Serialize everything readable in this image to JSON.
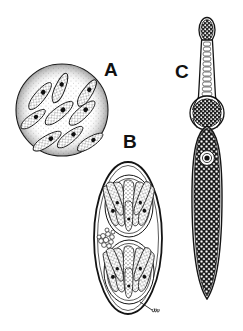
{
  "figure": {
    "kind": "scientific-line-illustration",
    "medium": "ink drawing, stippled",
    "background_color": "#ffffff",
    "ink_color": "#111111",
    "width": 243,
    "height": 331,
    "signature": "artist initials, lower right of panel B"
  },
  "labels": {
    "a": "A",
    "b": "B",
    "c": "C"
  },
  "panels": [
    {
      "id": "a",
      "label": "A",
      "name": "cyst-with-bradyzoites",
      "shape": "circle",
      "center": [
        62,
        110
      ],
      "radius": 46,
      "outline": "thin ink circle with dense stipple band inside rim",
      "contents": "nine elongated banana-shaped crescent cells, each stippled with a solid dark nucleus",
      "cell_count": 9,
      "cells": [
        {
          "cx": 40,
          "cy": 96,
          "angle": -52,
          "len": 34,
          "wid": 11,
          "nucleus_t": 0.62
        },
        {
          "cx": 60,
          "cy": 88,
          "angle": -68,
          "len": 32,
          "wid": 11,
          "nucleus_t": 0.58
        },
        {
          "cx": 86,
          "cy": 92,
          "angle": -58,
          "len": 31,
          "wid": 11,
          "nucleus_t": 0.6
        },
        {
          "cx": 33,
          "cy": 118,
          "angle": -38,
          "len": 30,
          "wid": 10,
          "nucleus_t": 0.58
        },
        {
          "cx": 59,
          "cy": 113,
          "angle": -40,
          "len": 35,
          "wid": 12,
          "nucleus_t": 0.6
        },
        {
          "cx": 82,
          "cy": 113,
          "angle": -44,
          "len": 34,
          "wid": 12,
          "nucleus_t": 0.58
        },
        {
          "cx": 47,
          "cy": 140,
          "angle": -34,
          "len": 33,
          "wid": 11,
          "nucleus_t": 0.58
        },
        {
          "cx": 70,
          "cy": 136,
          "angle": -40,
          "len": 32,
          "wid": 11,
          "nucleus_t": 0.6
        },
        {
          "cx": 90,
          "cy": 142,
          "angle": -34,
          "len": 30,
          "wid": 11,
          "nucleus_t": 0.58
        }
      ]
    },
    {
      "id": "b",
      "label": "B",
      "name": "sporulated-oocyst",
      "shape": "ellipse",
      "center": [
        128,
        238
      ],
      "rx": 34,
      "ry": 76,
      "outline": "thick outer oocyst wall, thin inner wall",
      "sporocyst_count": 2,
      "sporocysts": [
        {
          "cx": 129,
          "cy": 206,
          "rx": 24,
          "ry": 31,
          "sporozoites": 8
        },
        {
          "cx": 129,
          "cy": 272,
          "rx": 25,
          "ry": 32,
          "sporozoites": 8
        }
      ],
      "residual_body": {
        "cx": 107,
        "cy": 240,
        "granules": 11,
        "note": "small granular cluster between sporocysts"
      }
    },
    {
      "id": "c",
      "label": "C",
      "name": "elongate-sporont",
      "shape": "club-shaped elongate body",
      "extent": [
        193,
        18,
        221,
        300
      ],
      "parts": [
        {
          "part": "apical-bulb",
          "cy": 30,
          "note": "narrow rounded knob with internal granules"
        },
        {
          "part": "neck",
          "span": [
            40,
            98
          ],
          "note": "slender stalk with internal ladder of small segments"
        },
        {
          "part": "mid-organelle",
          "cy": 113,
          "r": 17,
          "note": "round densely stippled body at neck junction"
        },
        {
          "part": "main-body",
          "span": [
            130,
            296
          ],
          "note": "large lanceolate densely granular body, double membrane outline"
        },
        {
          "part": "nucleus",
          "cx": 207,
          "cy": 158,
          "note": "dark dot inside clear ring halo"
        }
      ]
    }
  ]
}
